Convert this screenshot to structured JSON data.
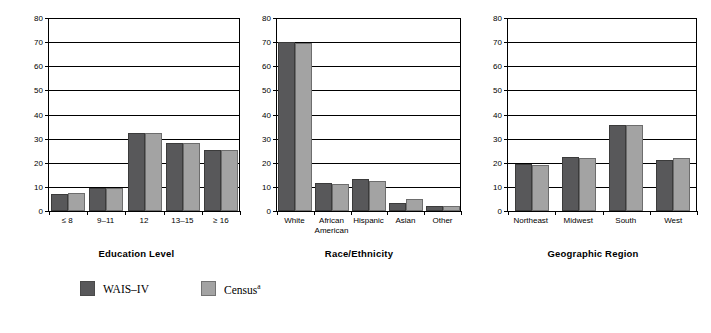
{
  "chart_data": [
    {
      "type": "bar",
      "title": "",
      "xlabel": "Education Level",
      "ylabel": "Percentage",
      "ylim": [
        0,
        80
      ],
      "yticks": [
        0,
        10,
        20,
        30,
        40,
        50,
        60,
        70,
        80
      ],
      "grid": true,
      "legend_position": "bottom",
      "categories": [
        "≤ 8",
        "9–11",
        "12",
        "13–15",
        "≥ 16"
      ],
      "series": [
        {
          "name": "WAIS–IV",
          "values": [
            7.2,
            9.5,
            32.2,
            28.4,
            25.3
          ],
          "color": "#58585a"
        },
        {
          "name": "Census",
          "values": [
            7.3,
            9.4,
            32.2,
            28.3,
            25.4
          ],
          "color": "#a3a3a3"
        }
      ]
    },
    {
      "type": "bar",
      "title": "",
      "xlabel": "Race/Ethnicity",
      "ylabel": "Percentage",
      "ylim": [
        0,
        80
      ],
      "yticks": [
        0,
        10,
        20,
        30,
        40,
        50,
        60,
        70,
        80
      ],
      "grid": true,
      "legend_position": "bottom",
      "categories": [
        "White",
        "African\nAmerican",
        "Hispanic",
        "Asian",
        "Other"
      ],
      "series": [
        {
          "name": "WAIS–IV",
          "values": [
            70.0,
            11.8,
            13.2,
            3.5,
            2.2
          ],
          "color": "#58585a"
        },
        {
          "name": "Census",
          "values": [
            69.7,
            11.0,
            12.6,
            4.9,
            2.2
          ],
          "color": "#a3a3a3"
        }
      ]
    },
    {
      "type": "bar",
      "title": "",
      "xlabel": "Geographic Region",
      "ylabel": "Percentage",
      "ylim": [
        0,
        80
      ],
      "yticks": [
        0,
        10,
        20,
        30,
        40,
        50,
        60,
        70,
        80
      ],
      "grid": true,
      "legend_position": "bottom",
      "categories": [
        "Northeast",
        "Midwest",
        "South",
        "West"
      ],
      "series": [
        {
          "name": "WAIS–IV",
          "values": [
            19.4,
            22.5,
            35.5,
            21.2
          ],
          "color": "#58585a"
        },
        {
          "name": "Census",
          "values": [
            19.0,
            21.8,
            35.5,
            21.8
          ],
          "color": "#a3a3a3"
        }
      ]
    }
  ],
  "legend": {
    "items": [
      {
        "label": "WAIS–IV",
        "superscript": "",
        "color": "#58585a"
      },
      {
        "label": "Census",
        "superscript": "a",
        "color": "#a3a3a3"
      }
    ]
  },
  "axis": {
    "y_title": "Percentage"
  },
  "colors": {
    "series_wais": "#58585a",
    "series_census": "#a3a3a3",
    "axis": "#000000",
    "background": "#ffffff"
  }
}
